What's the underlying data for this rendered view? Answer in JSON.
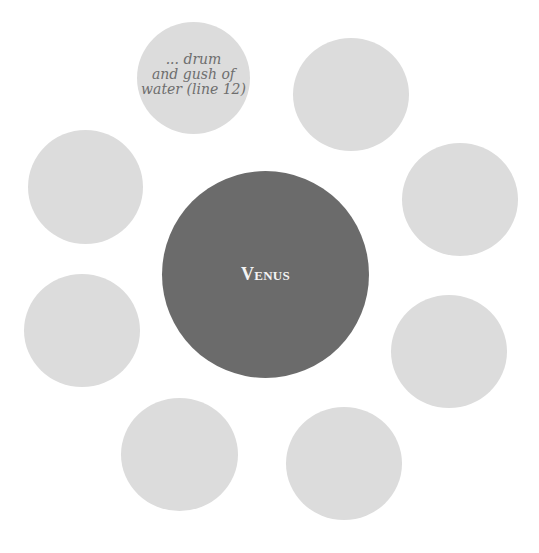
{
  "diagram": {
    "type": "web/cluster diagram",
    "center": {
      "label": "Venus",
      "color": "#6b6b6b"
    },
    "outer_color": "#dcdcdc",
    "nodes": [
      {
        "id": "n1",
        "text_lines": [
          "... drum",
          "and gush of",
          "water (line 12)"
        ]
      },
      {
        "id": "n2",
        "text_lines": []
      },
      {
        "id": "n3",
        "text_lines": []
      },
      {
        "id": "n4",
        "text_lines": []
      },
      {
        "id": "n5",
        "text_lines": []
      },
      {
        "id": "n6",
        "text_lines": []
      },
      {
        "id": "n7",
        "text_lines": []
      },
      {
        "id": "n8",
        "text_lines": []
      }
    ]
  }
}
